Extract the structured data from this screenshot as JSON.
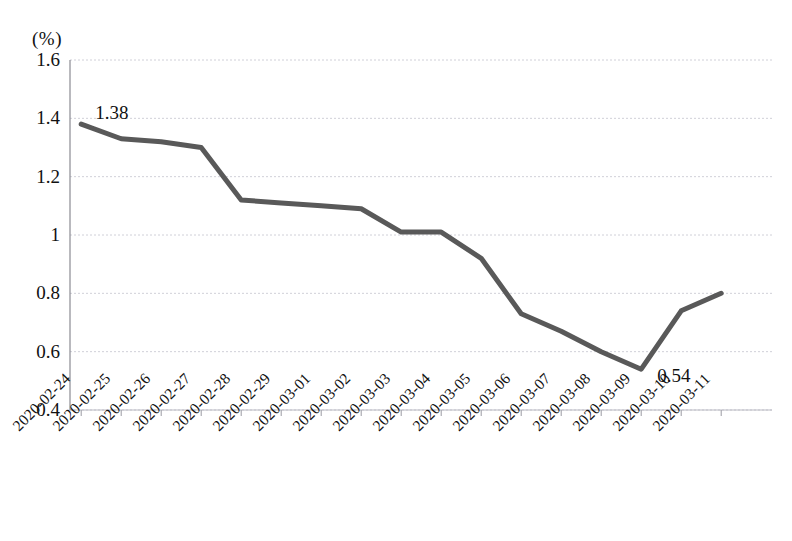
{
  "chart_data": {
    "type": "line",
    "title": "",
    "xlabel": "",
    "ylabel": "(%)",
    "unit_label": "(%)",
    "categories": [
      "2020-02-24",
      "2020-02-25",
      "2020-02-26",
      "2020-02-27",
      "2020-02-28",
      "2020-02-29",
      "2020-03-01",
      "2020-03-02",
      "2020-03-03",
      "2020-03-04",
      "2020-03-05",
      "2020-03-06",
      "2020-03-07",
      "2020-03-08",
      "2020-03-09",
      "2020-03-10",
      "2020-03-11"
    ],
    "values": [
      1.38,
      1.33,
      1.32,
      1.3,
      1.12,
      1.11,
      1.1,
      1.09,
      1.01,
      1.01,
      0.92,
      0.73,
      0.67,
      0.6,
      0.54,
      0.74,
      0.8
    ],
    "ylim": [
      0.4,
      1.6
    ],
    "yticks": [
      "1.6",
      "1.4",
      "1.2",
      "1",
      "0.8",
      "0.6",
      "0.4"
    ],
    "ytick_values": [
      1.6,
      1.4,
      1.2,
      1.0,
      0.8,
      0.6,
      0.4
    ],
    "grid": true,
    "legend": null,
    "legend_position": "none",
    "series_color": "#595959",
    "grid_color": "#d0d0d8",
    "annotations": [
      {
        "text": "1.38",
        "category": "2020-02-24",
        "value": 1.38
      },
      {
        "text": "0.54",
        "category": "2020-03-09",
        "value": 0.54
      }
    ]
  },
  "caption": ""
}
